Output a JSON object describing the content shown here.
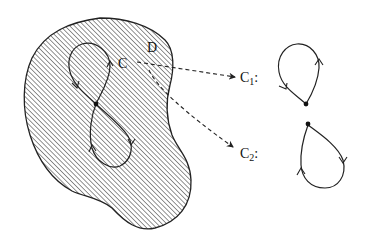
{
  "diagram": {
    "region_label": "D",
    "curve_label": "C",
    "subcurves": [
      {
        "label": "C",
        "subscript": "1",
        "suffix": ":"
      },
      {
        "label": "C",
        "subscript": "2",
        "suffix": ":"
      }
    ],
    "colors": {
      "stroke": "#222222",
      "hatch": "#6e6e6e",
      "background": "#ffffff"
    }
  }
}
